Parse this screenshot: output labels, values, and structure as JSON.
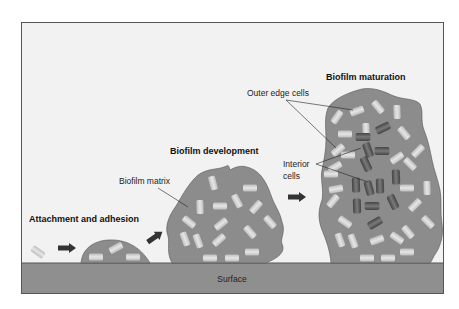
{
  "stages": {
    "attachment": "Attachment and adhesion",
    "development": "Biofilm development",
    "maturation": "Biofilm maturation"
  },
  "labels": {
    "biofilm_matrix": "Biofilm matrix",
    "outer_edge_cells": "Outer edge cells",
    "interior_cells_line1": "Interior",
    "interior_cells_line2": "cells",
    "surface": "Surface"
  },
  "colors": {
    "background": "#f2f2f2",
    "frame": "#555555",
    "surface": "#8f8f8f",
    "matrix": "#8c8c8c",
    "outer_cell": "#d4d4d4",
    "interior_cell": "#5a5a5a",
    "arrow": "#333333"
  }
}
